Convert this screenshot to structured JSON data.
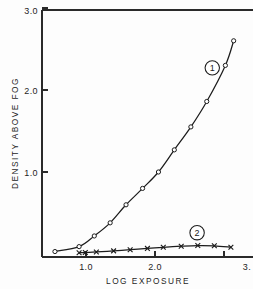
{
  "chart_data": {
    "type": "line",
    "title": "",
    "xlabel": "LOG EXPOSURE",
    "ylabel": "DENSITY ABOVE FOG",
    "xlim": [
      0.42,
      3.16
    ],
    "ylim": [
      0.0,
      3.0
    ],
    "xticks": [
      1.0,
      2.0,
      3.0
    ],
    "xtick_labels": [
      "1.0",
      "2.0",
      "3."
    ],
    "yticks": [
      1.0,
      2.0,
      3.0
    ],
    "ytick_labels": [
      "1.0",
      "2.0",
      "3.0"
    ],
    "grid": false,
    "legend_position": "inline-annotation",
    "series": [
      {
        "name": "1",
        "badge_label": "1",
        "marker": "open-circle",
        "badge_x": 2.83,
        "badge_y": 2.27,
        "x": [
          0.55,
          0.9,
          1.12,
          1.35,
          1.58,
          1.82,
          2.05,
          2.28,
          2.52,
          2.75,
          3.02,
          3.14
        ],
        "y": [
          0.03,
          0.09,
          0.22,
          0.38,
          0.6,
          0.8,
          1.0,
          1.27,
          1.55,
          1.86,
          2.3,
          2.6
        ]
      },
      {
        "name": "2",
        "badge_label": "2",
        "marker": "cross",
        "badge_x": 2.61,
        "badge_y": 0.26,
        "x": [
          0.9,
          0.99,
          1.15,
          1.4,
          1.64,
          1.89,
          2.12,
          2.38,
          2.62,
          2.86,
          3.1
        ],
        "y": [
          0.015,
          0.018,
          0.025,
          0.038,
          0.052,
          0.068,
          0.082,
          0.095,
          0.103,
          0.1,
          0.082
        ]
      }
    ]
  },
  "axes": {
    "y_axis_title": "DENSITY ABOVE FOG",
    "x_axis_title": "LOG EXPOSURE",
    "y_tick_0": "1.0",
    "y_tick_1": "2.0",
    "y_tick_2": "3.0",
    "x_tick_0": "1.0",
    "x_tick_1": "2.0",
    "x_tick_2": "3."
  },
  "annotations": {
    "series_one_badge": "1",
    "series_two_badge": "2"
  },
  "colors": {
    "ink": "#1c1c1c",
    "axis": "#2a2a2a",
    "background": "#fdfdfd"
  }
}
